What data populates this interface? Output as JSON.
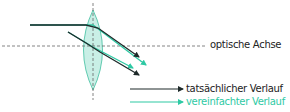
{
  "diagram": {
    "labels": {
      "optical_axis": "optische Achse",
      "legend_actual": "tatsächlicher Verlauf",
      "legend_simplified": "vereinfachter Verlauf"
    },
    "colors": {
      "actual_ray": "#1e2a2a",
      "simplified_ray": "#2ec9a4",
      "lens_fill": "#c9efe6",
      "lens_stroke": "#3fbfa0",
      "axis": "#666666",
      "label_text": "#222222"
    }
  }
}
